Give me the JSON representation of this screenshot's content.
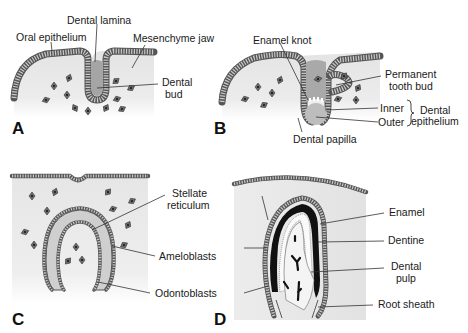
{
  "figure": {
    "colors": {
      "background": "#ffffff",
      "mesenchyme": "#e6e6e6",
      "epithelium": "#a9a9a9",
      "epithelium_edge": "#555555",
      "papilla": "#bdbdbd",
      "enamel": "#111111",
      "text": "#1a1a1a"
    },
    "panels": [
      {
        "id": "A",
        "letter": "A",
        "labels": {
          "oral_epithelium": "Oral epithelium",
          "dental_lamina": "Dental lamina",
          "mesenchyme_jaw": "Mesenchyme jaw",
          "dental_bud_line1": "Dental",
          "dental_bud_line2": "bud"
        }
      },
      {
        "id": "B",
        "letter": "B",
        "labels": {
          "enamel_knot": "Enamel knot",
          "permanent_tooth_bud_line1": "Permanent",
          "permanent_tooth_bud_line2": "tooth bud",
          "inner": "Inner",
          "outer": "Outer",
          "dental_epithelium_line1": "Dental",
          "dental_epithelium_line2": "epithelium",
          "dental_papilla": "Dental papilla"
        }
      },
      {
        "id": "C",
        "letter": "C",
        "labels": {
          "stellate_reticulum_line1": "Stellate",
          "stellate_reticulum_line2": "reticulum",
          "ameloblasts": "Ameloblasts",
          "odontoblasts": "Odontoblasts"
        }
      },
      {
        "id": "D",
        "letter": "D",
        "labels": {
          "enamel": "Enamel",
          "dentine": "Dentine",
          "dental_pulp_line1": "Dental",
          "dental_pulp_line2": "pulp",
          "root_sheath": "Root sheath"
        }
      }
    ]
  }
}
